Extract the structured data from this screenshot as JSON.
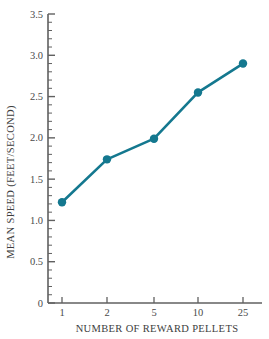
{
  "chart_data": {
    "type": "line",
    "title": "",
    "xlabel": "NUMBER OF REWARD PELLETS",
    "ylabel": "MEAN SPEED (FEET/SECOND)",
    "categories": [
      "1",
      "2",
      "5",
      "10",
      "25"
    ],
    "x": [
      1,
      2,
      5,
      10,
      25
    ],
    "values": [
      1.22,
      1.74,
      1.99,
      2.55,
      2.9
    ],
    "series": [
      {
        "name": "mean speed",
        "values": [
          1.22,
          1.74,
          1.99,
          2.55,
          2.9
        ]
      }
    ],
    "ylim": [
      0,
      3.5
    ],
    "y_ticks": [
      "0",
      "0.5",
      "1.0",
      "1.5",
      "2.0",
      "2.5",
      "3.0",
      "3.5"
    ],
    "y_tick_values": [
      0,
      0.5,
      1.0,
      1.5,
      2.0,
      2.5,
      3.0,
      3.5
    ],
    "y_minor_tick_interval": 0.1,
    "x_tick_labels": [
      "1",
      "2",
      "5",
      "10",
      "25"
    ],
    "x_axis_scale": "categorical",
    "grid": false,
    "legend": false,
    "legend_position": "none",
    "line_color": "#14788f",
    "marker_color": "#14788f",
    "marker_shape": "circle",
    "axis_color": "#606060",
    "background_color": "#ffffff"
  },
  "axes": {
    "y_labels": [
      "3.5",
      "3.0",
      "2.5",
      "2.0",
      "1.5",
      "1.0",
      "0.5",
      "0"
    ],
    "x_labels": [
      "1",
      "2",
      "5",
      "10",
      "25"
    ],
    "y_title": "MEAN SPEED (FEET/SECOND)",
    "x_title": "NUMBER OF REWARD PELLETS"
  }
}
